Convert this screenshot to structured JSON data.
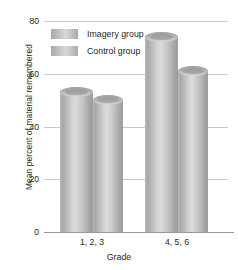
{
  "chart_data": {
    "type": "bar",
    "title": "",
    "xlabel": "Grade",
    "ylabel": "Mean percent of material remembered",
    "categories": [
      "1, 2, 3",
      "4, 5, 6"
    ],
    "series": [
      {
        "name": "Imagery group",
        "values": [
          53,
          74
        ]
      },
      {
        "name": "Control group",
        "values": [
          50,
          61
        ]
      }
    ],
    "ylim": [
      0,
      80
    ],
    "yticks": [
      0,
      20,
      40,
      60,
      80
    ],
    "ytick_labels": [
      "0",
      "20",
      "40",
      "60",
      "80"
    ],
    "grid": true,
    "legend_position": "top-left",
    "bar_style": "cylinder-3d",
    "colors": {
      "bar_light": "#d8d8d8",
      "bar_mid": "#bdbdbd",
      "bar_dark": "#9c9c9c",
      "gridline": "#c9c9c9",
      "axis": "#9a9a9a",
      "text": "#231f20",
      "background": "#ffffff"
    }
  },
  "legend": {
    "items": [
      {
        "label": "Imagery group"
      },
      {
        "label": "Control group"
      }
    ]
  },
  "axes": {
    "y_title": "Mean percent of material remembered",
    "x_title": "Grade",
    "y_labels": [
      "80",
      "60",
      "40",
      "20",
      "0"
    ],
    "x_labels": [
      "1, 2, 3",
      "4, 5, 6"
    ]
  }
}
